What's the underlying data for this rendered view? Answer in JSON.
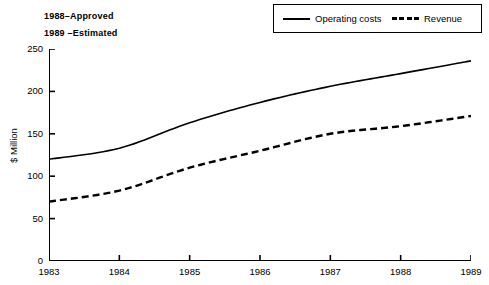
{
  "annotations": {
    "line1": "1988–Approved",
    "line2": "1989 –Estimated"
  },
  "legend": {
    "operating_label": "Operating costs",
    "revenue_label": "Revenue"
  },
  "axes": {
    "ylabel": "$ Million",
    "yticks": [
      "0",
      "50",
      "100",
      "150",
      "200",
      "250"
    ],
    "xticks": [
      "1983",
      "1984",
      "1985",
      "1986",
      "1987",
      "1988",
      "1989"
    ]
  },
  "chart_data": {
    "type": "line",
    "title": "",
    "xlabel": "",
    "ylabel": "$ Million",
    "x": [
      1983,
      1984,
      1985,
      1986,
      1987,
      1988,
      1989
    ],
    "categories": [
      "1983",
      "1984",
      "1985",
      "1986",
      "1987",
      "1988",
      "1989"
    ],
    "series": [
      {
        "name": "Operating costs",
        "style": "solid",
        "color": "#000000",
        "values": [
          120,
          133,
          163,
          187,
          206,
          221,
          236
        ]
      },
      {
        "name": "Revenue",
        "style": "dashed",
        "color": "#000000",
        "values": [
          70,
          83,
          110,
          130,
          150,
          159,
          171
        ]
      }
    ],
    "xlim": [
      1983,
      1989
    ],
    "ylim": [
      0,
      250
    ],
    "ytick_values": [
      0,
      50,
      100,
      150,
      200,
      250
    ],
    "grid": false,
    "legend_position": "top-right",
    "annotations": [
      "1988–Approved",
      "1989 –Estimated"
    ]
  }
}
